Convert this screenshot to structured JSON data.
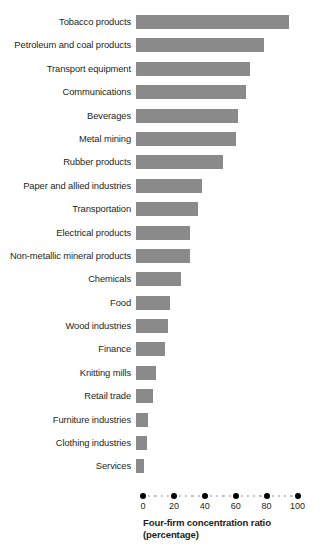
{
  "chart_data": {
    "type": "bar",
    "orientation": "horizontal",
    "title": "",
    "xlabel": "Four-firm concentration ratio (percentage)",
    "xlabel_line1": "Four-firm concentration ratio",
    "xlabel_line2": "(percentage)",
    "ylabel": "",
    "xlim": [
      0,
      100
    ],
    "xticks": [
      0,
      20,
      40,
      60,
      80,
      100
    ],
    "xtick_labels": [
      "0",
      "20",
      "40",
      "60",
      "80",
      "100"
    ],
    "grid": false,
    "legend": null,
    "bar_color": "#8a8a8a",
    "text_color": "#231f20",
    "categories": [
      "Tobacco products",
      "Petroleum and coal products",
      "Transport equipment",
      "Communications",
      "Beverages",
      "Metal mining",
      "Rubber products",
      "Paper and allied industries",
      "Transportation",
      "Electrical products",
      "Non-metallic mineral products",
      "Chemicals",
      "Food",
      "Wood industries",
      "Finance",
      "Knitting mills",
      "Retail trade",
      "Furniture industries",
      "Clothing industries",
      "Services"
    ],
    "values": [
      99,
      83,
      74,
      71,
      66,
      65,
      56,
      43,
      40,
      35,
      35,
      29,
      22,
      21,
      19,
      13,
      11,
      8,
      7,
      5
    ]
  }
}
